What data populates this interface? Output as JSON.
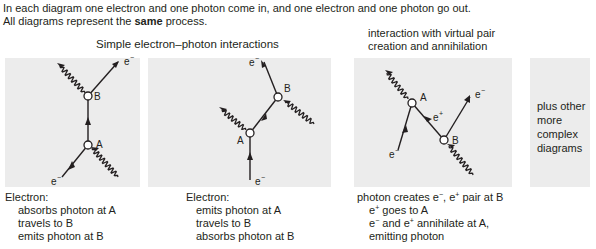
{
  "intro": {
    "line1": "In each diagram one electron and one photon come in, and one electron and one photon go out.",
    "line2_before": "All diagrams represent the ",
    "line2_bold": "same",
    "line2_after": " process."
  },
  "headings": {
    "simple": "Simple electron–photon interactions",
    "virtual_line1": "interaction with virtual pair",
    "virtual_line2": "creation and annihilation"
  },
  "diagrams": [
    {
      "vertex_labels": [
        "A",
        "B"
      ],
      "particle_labels": [
        "e",
        "e"
      ],
      "charge": "−",
      "caption": {
        "title": "Electron:",
        "lines": [
          "absorbs photon at A",
          "travels to B",
          "emits photon at B"
        ]
      }
    },
    {
      "vertex_labels": [
        "A",
        "B"
      ],
      "particle_labels": [
        "e",
        "e"
      ],
      "charge": "−",
      "caption": {
        "title": "Electron:",
        "lines": [
          "emits photon at A",
          "travels to B",
          "absorbs photon at B"
        ]
      }
    },
    {
      "vertex_labels": [
        "A",
        "B"
      ],
      "particle_labels": [
        "e",
        "e",
        "e"
      ],
      "charges": [
        "−",
        "+",
        "−"
      ],
      "caption": {
        "line1_a": "photon creates e",
        "line1_b": ", e",
        "line1_c": " pair at B",
        "line2_a": "e",
        "line2_b": " goes to A",
        "line3_a": "e",
        "line3_b": " and e",
        "line3_c": " annihilate at A,",
        "line4": "emitting photon",
        "minus": "−",
        "plus": "+"
      }
    }
  ],
  "other": {
    "lines": [
      "plus other",
      "more",
      "complex",
      "diagrams"
    ]
  }
}
